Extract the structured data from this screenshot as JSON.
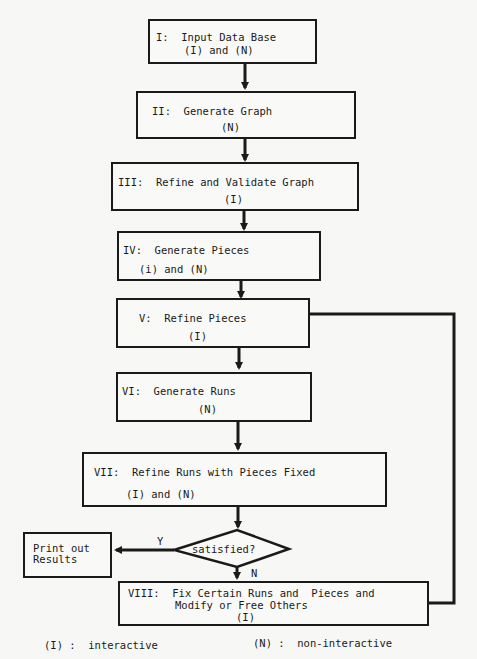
{
  "diagram": {
    "nodes": [
      {
        "id": "I",
        "line1": "I:  Input Data Base",
        "line2": "(I) and (N)"
      },
      {
        "id": "II",
        "line1": "II:  Generate Graph",
        "line2": "(N)"
      },
      {
        "id": "III",
        "line1": "III:  Refine and Validate Graph",
        "line2": "(I)"
      },
      {
        "id": "IV",
        "line1": "IV:  Generate Pieces",
        "line2": "(i) and (N)"
      },
      {
        "id": "V",
        "line1": "V:  Refine Pieces",
        "line2": "(I)"
      },
      {
        "id": "VI",
        "line1": "VI:  Generate Runs",
        "line2": "(N)"
      },
      {
        "id": "VII",
        "line1": "VII:  Refine Runs with Pieces Fixed",
        "line2": "(I) and (N)"
      },
      {
        "id": "VIII",
        "line1": "VIII:  Fix Certain Runs and  Pieces and",
        "line2": "Modify or Free Others",
        "line3": "(I)"
      }
    ],
    "decision": {
      "label": "satisfied?",
      "yes_label": "Y",
      "no_label": "N"
    },
    "output": {
      "line1": "Print out",
      "line2": "Results"
    },
    "legend": {
      "interactive": "(I) :  interactive",
      "non_interactive": "(N) :  non-interactive"
    }
  }
}
